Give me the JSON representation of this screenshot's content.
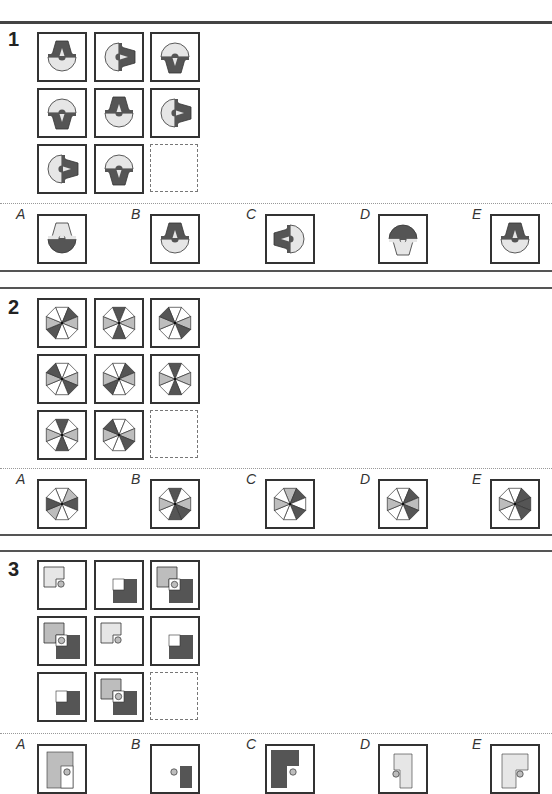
{
  "colors": {
    "dark": "#555555",
    "light": "#e6e6e6",
    "mid": "#bdbdbd",
    "line": "#333333"
  },
  "questions": [
    {
      "number": "1",
      "type": "rotating-shield",
      "grid": [
        [
          "up-dark-top",
          "right-dark-right",
          "down-dark-bottom"
        ],
        [
          "down-dark-bottom",
          "up-dark-top",
          "right-dark-right"
        ],
        [
          "right-dark-right",
          "down-dark-bottom",
          "blank"
        ]
      ],
      "options": [
        {
          "label": "A",
          "figure": "up-light-top"
        },
        {
          "label": "B",
          "figure": "up-dark-top"
        },
        {
          "label": "C",
          "figure": "left-dark-left"
        },
        {
          "label": "D",
          "figure": "down-light-bottom"
        },
        {
          "label": "E",
          "figure": "up-dark-top-alt"
        }
      ]
    },
    {
      "number": "2",
      "type": "octagon-sectors",
      "grid": [
        [
          "p1",
          "p2",
          "p3"
        ],
        [
          "p3",
          "p1",
          "p2"
        ],
        [
          "p2",
          "p3",
          "blank"
        ]
      ],
      "options": [
        {
          "label": "A",
          "figure": "oA"
        },
        {
          "label": "B",
          "figure": "oB"
        },
        {
          "label": "C",
          "figure": "oC"
        },
        {
          "label": "D",
          "figure": "oD"
        },
        {
          "label": "E",
          "figure": "oE"
        }
      ]
    },
    {
      "number": "3",
      "type": "overlay-squares",
      "grid": [
        [
          "L",
          "D",
          "LD"
        ],
        [
          "LD",
          "L",
          "D"
        ],
        [
          "D",
          "LD",
          "blank"
        ]
      ],
      "options": [
        {
          "label": "A",
          "figure": "a"
        },
        {
          "label": "B",
          "figure": "b"
        },
        {
          "label": "C",
          "figure": "c"
        },
        {
          "label": "D",
          "figure": "d"
        },
        {
          "label": "E",
          "figure": "e"
        }
      ]
    }
  ]
}
